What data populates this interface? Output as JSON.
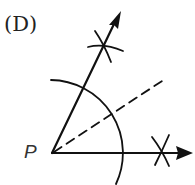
{
  "figure": {
    "option_label": "(D)",
    "vertex_label": "P",
    "colors": {
      "stroke": "#111111",
      "background": "#ffffff"
    }
  },
  "geometry": {
    "vertex": [
      52,
      153
    ],
    "horizontal_ray_end": [
      193,
      153
    ],
    "upper_ray_end": [
      121,
      11
    ],
    "arc_radius": 71,
    "upper_mark": [
      104,
      46
    ],
    "right_mark": [
      163,
      153
    ],
    "bisector_end": [
      162,
      81
    ]
  }
}
